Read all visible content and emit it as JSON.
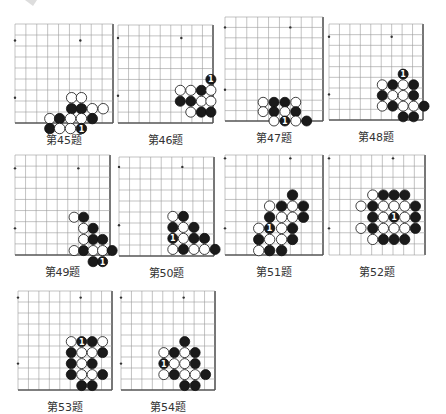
{
  "page": {
    "background": "#ffffff",
    "line_color": "#9a9a9a",
    "edge_color": "#555555",
    "black_stone": "#1a1a1a",
    "white_stone": "#ffffff"
  },
  "problems": [
    {
      "id": "45",
      "caption": "第45题",
      "x": 15,
      "y": 24,
      "w": 98,
      "h": 99,
      "cols": 9,
      "rows": 9,
      "edges": [
        "right",
        "bottom"
      ],
      "stars": [
        [
          0,
          1.5
        ],
        [
          6,
          1.5
        ],
        [
          0,
          6.7
        ]
      ],
      "stones": [
        [
          5.2,
          6.7,
          "W"
        ],
        [
          6.1,
          6.7,
          "W"
        ],
        [
          5.2,
          7.7,
          "B"
        ],
        [
          6.1,
          7.7,
          "B"
        ],
        [
          7.1,
          7.7,
          "W"
        ],
        [
          8.1,
          7.7,
          "W"
        ],
        [
          3.2,
          8.6,
          "W"
        ],
        [
          4.1,
          8.6,
          "B"
        ],
        [
          5.1,
          8.6,
          "W"
        ],
        [
          6.1,
          8.6,
          "W"
        ],
        [
          7.1,
          8.6,
          "B"
        ],
        [
          3.2,
          9.5,
          "B"
        ],
        [
          4.1,
          9.5,
          "W"
        ],
        [
          5.1,
          9.5,
          "W"
        ],
        [
          6.1,
          9.5,
          "B",
          "1"
        ]
      ]
    },
    {
      "id": "46",
      "caption": "第46题",
      "x": 118,
      "y": 25,
      "w": 95,
      "h": 98,
      "cols": 9,
      "rows": 9,
      "edges": [
        "right",
        "bottom"
      ],
      "stars": [
        [
          0,
          1.2
        ],
        [
          6,
          1.2
        ],
        [
          0,
          6.5
        ]
      ],
      "stones": [
        [
          8.8,
          5.0,
          "B",
          "1"
        ],
        [
          5.9,
          6.0,
          "W"
        ],
        [
          6.9,
          6.0,
          "W"
        ],
        [
          7.9,
          6.0,
          "B"
        ],
        [
          8.8,
          6.0,
          "W"
        ],
        [
          5.9,
          7.0,
          "B"
        ],
        [
          6.9,
          7.0,
          "B"
        ],
        [
          7.9,
          7.0,
          "W"
        ],
        [
          8.8,
          7.0,
          "W"
        ],
        [
          6.9,
          8.0,
          "W"
        ],
        [
          7.9,
          8.0,
          "B"
        ],
        [
          8.8,
          8.0,
          "B"
        ]
      ]
    },
    {
      "id": "47",
      "caption": "第47题",
      "x": 225,
      "y": 17,
      "w": 98,
      "h": 104,
      "cols": 9,
      "rows": 10,
      "edges": [
        "right",
        "bottom"
      ],
      "stars": [
        [
          0,
          1.0
        ],
        [
          6,
          1.0
        ],
        [
          0,
          7.0
        ]
      ],
      "stones": [
        [
          3.5,
          8.2,
          "W"
        ],
        [
          4.5,
          8.2,
          "B"
        ],
        [
          5.5,
          8.2,
          "B"
        ],
        [
          6.5,
          8.2,
          "W"
        ],
        [
          3.5,
          9.1,
          "W"
        ],
        [
          4.5,
          9.1,
          "B"
        ],
        [
          5.5,
          9.1,
          "W"
        ],
        [
          6.5,
          9.1,
          "B"
        ],
        [
          4.5,
          10.0,
          "W"
        ],
        [
          5.5,
          10.0,
          "B",
          "1"
        ],
        [
          6.5,
          10.0,
          "W"
        ],
        [
          7.5,
          10.0,
          "B"
        ]
      ]
    },
    {
      "id": "48",
      "caption": "第48题",
      "x": 329,
      "y": 24,
      "w": 94,
      "h": 96,
      "cols": 9,
      "rows": 9,
      "edges": [
        "right",
        "bottom"
      ],
      "stars": [
        [
          0,
          1.2
        ],
        [
          6,
          1.2
        ],
        [
          0,
          6.6
        ]
      ],
      "stones": [
        [
          7.1,
          4.7,
          "B",
          "1"
        ],
        [
          5.1,
          5.7,
          "W"
        ],
        [
          6.1,
          5.7,
          "B"
        ],
        [
          7.1,
          5.7,
          "W"
        ],
        [
          8.1,
          5.7,
          "B"
        ],
        [
          5.1,
          6.7,
          "B"
        ],
        [
          6.1,
          6.7,
          "W"
        ],
        [
          7.1,
          6.7,
          "W"
        ],
        [
          8.1,
          6.7,
          "B"
        ],
        [
          5.1,
          7.7,
          "W"
        ],
        [
          6.1,
          7.7,
          "B"
        ],
        [
          7.1,
          7.7,
          "W"
        ],
        [
          8.1,
          7.7,
          "W"
        ],
        [
          9.1,
          7.7,
          "B"
        ],
        [
          7.1,
          8.7,
          "B"
        ],
        [
          8.1,
          8.7,
          "B"
        ]
      ]
    },
    {
      "id": "49",
      "caption": "第49题",
      "x": 15,
      "y": 155,
      "w": 95,
      "h": 100,
      "cols": 9,
      "rows": 9,
      "edges": [
        "right",
        "bottom"
      ],
      "stars": [
        [
          0,
          1.2
        ],
        [
          6,
          1.2
        ],
        [
          0,
          6.6
        ]
      ],
      "stones": [
        [
          5.6,
          5.6,
          "W"
        ],
        [
          6.5,
          5.6,
          "B"
        ],
        [
          6.5,
          6.6,
          "W"
        ],
        [
          7.4,
          6.6,
          "B"
        ],
        [
          6.5,
          7.6,
          "W"
        ],
        [
          7.4,
          7.6,
          "B"
        ],
        [
          8.3,
          7.6,
          "B"
        ],
        [
          5.6,
          8.6,
          "W"
        ],
        [
          6.5,
          8.6,
          "B"
        ],
        [
          7.4,
          8.6,
          "W"
        ],
        [
          8.3,
          8.6,
          "W"
        ],
        [
          9.2,
          8.6,
          "B"
        ],
        [
          7.4,
          9.6,
          "B"
        ],
        [
          8.3,
          9.6,
          "B",
          "1"
        ]
      ]
    },
    {
      "id": "50",
      "caption": "第50题",
      "x": 119,
      "y": 157,
      "w": 95,
      "h": 99,
      "cols": 9,
      "rows": 9,
      "edges": [
        "right",
        "bottom"
      ],
      "stars": [
        [
          0,
          0.9
        ],
        [
          6,
          0.9
        ],
        [
          0,
          6.2
        ]
      ],
      "stones": [
        [
          5.1,
          5.4,
          "W"
        ],
        [
          6.1,
          5.4,
          "B"
        ],
        [
          5.1,
          6.4,
          "B"
        ],
        [
          6.1,
          6.4,
          "W"
        ],
        [
          7.1,
          6.4,
          "B"
        ],
        [
          5.1,
          7.4,
          "B",
          "1"
        ],
        [
          6.1,
          7.4,
          "W"
        ],
        [
          7.1,
          7.4,
          "B"
        ],
        [
          8.1,
          7.4,
          "B"
        ],
        [
          5.1,
          8.4,
          "W"
        ],
        [
          6.1,
          8.4,
          "B"
        ],
        [
          7.1,
          8.4,
          "W"
        ],
        [
          8.1,
          8.4,
          "W"
        ],
        [
          9.1,
          8.4,
          "B"
        ]
      ]
    },
    {
      "id": "51",
      "caption": "第51题",
      "x": 225,
      "y": 155,
      "w": 98,
      "h": 100,
      "cols": 9,
      "rows": 9,
      "edges": [
        "right",
        "bottom"
      ],
      "stars": [
        [
          0,
          0.3
        ],
        [
          6,
          0.3
        ],
        [
          0,
          6.6
        ]
      ],
      "stones": [
        [
          6.2,
          3.6,
          "B"
        ],
        [
          4.1,
          4.6,
          "W"
        ],
        [
          5.2,
          4.6,
          "B"
        ],
        [
          6.2,
          4.6,
          "W"
        ],
        [
          7.2,
          4.6,
          "B"
        ],
        [
          4.1,
          5.6,
          "B"
        ],
        [
          5.2,
          5.6,
          "W"
        ],
        [
          6.2,
          5.6,
          "W"
        ],
        [
          7.2,
          5.6,
          "B"
        ],
        [
          3.1,
          6.6,
          "W"
        ],
        [
          4.1,
          6.6,
          "B",
          "1"
        ],
        [
          5.2,
          6.6,
          "W"
        ],
        [
          6.2,
          6.6,
          "B"
        ],
        [
          3.1,
          7.6,
          "B"
        ],
        [
          4.1,
          7.6,
          "W"
        ],
        [
          5.2,
          7.6,
          "W"
        ],
        [
          6.2,
          7.6,
          "B"
        ],
        [
          3.1,
          8.6,
          "W"
        ],
        [
          4.1,
          8.6,
          "B"
        ],
        [
          5.2,
          8.6,
          "B"
        ]
      ]
    },
    {
      "id": "52",
      "caption": "第52题",
      "x": 329,
      "y": 155,
      "w": 96,
      "h": 100,
      "cols": 9,
      "rows": 9,
      "edges": [
        "right"
      ],
      "stars": [
        [
          0,
          0.3
        ],
        [
          6,
          0.3
        ],
        [
          0,
          6.6
        ]
      ],
      "stones": [
        [
          4.1,
          3.6,
          "W"
        ],
        [
          5.1,
          3.6,
          "B"
        ],
        [
          6.1,
          3.6,
          "B"
        ],
        [
          7.1,
          3.6,
          "B"
        ],
        [
          3.0,
          4.6,
          "W"
        ],
        [
          4.1,
          4.6,
          "B"
        ],
        [
          5.1,
          4.6,
          "W"
        ],
        [
          6.1,
          4.6,
          "W"
        ],
        [
          7.1,
          4.6,
          "W"
        ],
        [
          8.1,
          4.6,
          "B"
        ],
        [
          4.1,
          5.6,
          "B"
        ],
        [
          5.1,
          5.6,
          "W"
        ],
        [
          6.1,
          5.6,
          "B",
          "1"
        ],
        [
          7.1,
          5.6,
          "W"
        ],
        [
          8.1,
          5.6,
          "B"
        ],
        [
          3.0,
          6.6,
          "W"
        ],
        [
          4.1,
          6.6,
          "B"
        ],
        [
          5.1,
          6.6,
          "W"
        ],
        [
          6.1,
          6.6,
          "W"
        ],
        [
          7.1,
          6.6,
          "W"
        ],
        [
          8.1,
          6.6,
          "B"
        ],
        [
          4.1,
          7.6,
          "W"
        ],
        [
          5.1,
          7.6,
          "B"
        ],
        [
          6.1,
          7.6,
          "B"
        ],
        [
          7.1,
          7.6,
          "B"
        ]
      ]
    },
    {
      "id": "53",
      "caption": "第53题",
      "x": 18,
      "y": 291,
      "w": 94,
      "h": 99,
      "cols": 9,
      "rows": 9,
      "edges": [
        "right",
        "bottom"
      ],
      "stars": [
        [
          0,
          0.6
        ],
        [
          6,
          0.6
        ],
        [
          0,
          6.6
        ]
      ],
      "stones": [
        [
          5.1,
          4.6,
          "W"
        ],
        [
          6.1,
          4.6,
          "B",
          "1"
        ],
        [
          7.1,
          4.6,
          "B"
        ],
        [
          8.1,
          4.6,
          "W"
        ],
        [
          5.1,
          5.6,
          "B"
        ],
        [
          6.1,
          5.6,
          "W"
        ],
        [
          7.1,
          5.6,
          "W"
        ],
        [
          8.1,
          5.6,
          "B"
        ],
        [
          5.1,
          6.6,
          "B"
        ],
        [
          6.1,
          6.6,
          "W"
        ],
        [
          7.1,
          6.6,
          "B"
        ],
        [
          5.1,
          7.6,
          "B"
        ],
        [
          6.1,
          7.6,
          "W"
        ],
        [
          7.1,
          7.6,
          "W"
        ],
        [
          8.1,
          7.6,
          "B"
        ],
        [
          6.1,
          8.6,
          "B"
        ],
        [
          7.1,
          8.6,
          "B"
        ]
      ]
    },
    {
      "id": "54",
      "caption": "第54题",
      "x": 121,
      "y": 291,
      "w": 94,
      "h": 99,
      "cols": 9,
      "rows": 9,
      "edges": [
        "right",
        "bottom"
      ],
      "stars": [
        [
          0,
          0.6
        ],
        [
          6,
          0.6
        ],
        [
          0,
          6.6
        ]
      ],
      "stones": [
        [
          6.1,
          4.6,
          "B"
        ],
        [
          4.1,
          5.6,
          "W"
        ],
        [
          5.1,
          5.6,
          "B"
        ],
        [
          6.1,
          5.6,
          "W"
        ],
        [
          7.1,
          5.6,
          "B"
        ],
        [
          4.1,
          6.6,
          "B",
          "1"
        ],
        [
          5.1,
          6.6,
          "W"
        ],
        [
          6.1,
          6.6,
          "W"
        ],
        [
          7.1,
          6.6,
          "B"
        ],
        [
          4.1,
          7.6,
          "W"
        ],
        [
          5.1,
          7.6,
          "B"
        ],
        [
          6.1,
          7.6,
          "W"
        ],
        [
          7.1,
          7.6,
          "W"
        ],
        [
          8.1,
          7.6,
          "B"
        ],
        [
          6.1,
          8.6,
          "B"
        ],
        [
          7.1,
          8.6,
          "B"
        ]
      ]
    }
  ]
}
